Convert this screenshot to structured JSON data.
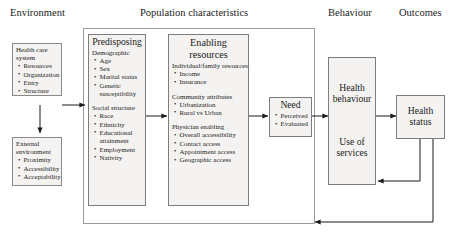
{
  "figure": {
    "kind": "flow-diagram",
    "column_labels": [
      {
        "text": "Environment"
      },
      {
        "text": "Population characteristics"
      },
      {
        "text": "Behaviour"
      },
      {
        "text": "Outcomes"
      }
    ]
  },
  "environment": {
    "health_care_system": {
      "title": "Health care system",
      "items": [
        "Resources",
        "Organization",
        "Entry",
        "Structure"
      ]
    },
    "external_environment": {
      "title": "External environment",
      "items": [
        "Proximity",
        "Accessibility",
        "Acceptability"
      ]
    }
  },
  "population": {
    "predisposing": {
      "title": "Predisposing",
      "groups": [
        {
          "heading": "Demographic",
          "items": [
            "Age",
            "Sex",
            "Marital status",
            "Genetic susceptibility"
          ]
        },
        {
          "heading": "Social structure",
          "items": [
            "Race",
            "Ethnicity",
            "Educational attainment",
            "Employment",
            "Nativity"
          ]
        }
      ]
    },
    "enabling": {
      "title_line1": "Enabling",
      "title_line2": "resources",
      "groups": [
        {
          "heading": "Individual/family resources",
          "items": [
            "Income",
            "Insurance"
          ]
        },
        {
          "heading": "Community attributes",
          "items": [
            "Urbanization",
            "Rural vs Urban"
          ]
        },
        {
          "heading": "Physician enabling",
          "items": [
            "Overall accessibility",
            "Contact access",
            "Appointment access",
            "Geographic access"
          ]
        }
      ]
    },
    "need": {
      "title": "Need",
      "items": [
        "Perceived",
        "Evaluated"
      ]
    }
  },
  "behaviour": {
    "health_behaviour": {
      "title_line1": "Health",
      "title_line2": "behaviour",
      "sub_line1": "Use of",
      "sub_line2": "services"
    }
  },
  "outcomes": {
    "health_status": {
      "title_line1": "Health",
      "title_line2": "status"
    }
  },
  "colors": {
    "box_fill": "#f4f3f1",
    "box_stroke": "#8a8a8a",
    "container_stroke": "#9a9a9a",
    "wire": "#1a1a1a",
    "text": "#1a1a1a"
  }
}
